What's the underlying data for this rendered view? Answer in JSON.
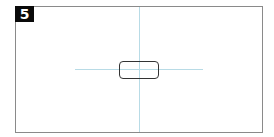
{
  "panel": {
    "badge_label": "5"
  },
  "colors": {
    "frame": "#8a8a8a",
    "badge_bg": "#0a0a0a",
    "crosshair": "#b8dbe6",
    "box_border": "#333333"
  }
}
